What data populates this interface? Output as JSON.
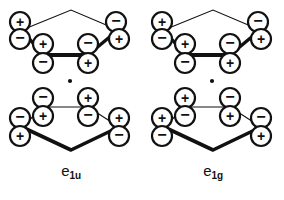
{
  "figure": {
    "name": "cyclopentadienyl-ring-pi-orbital-symmetry-diagram",
    "panels": [
      {
        "id": "e1u",
        "label_base": "e",
        "label_sub": "1u",
        "center_dot": true,
        "rings": [
          {
            "id": "upper-ring",
            "position": "upper",
            "lobes": [
              {
                "id": "ul-back-left-up",
                "sign": "+",
                "cx": 20,
                "cy": 22,
                "r": 10
              },
              {
                "id": "ul-back-left-down",
                "sign": "−",
                "cx": 20,
                "cy": 39,
                "r": 10
              },
              {
                "id": "ul-front-left-up",
                "sign": "+",
                "cx": 43,
                "cy": 44,
                "r": 10
              },
              {
                "id": "ul-front-left-down",
                "sign": "−",
                "cx": 43,
                "cy": 63,
                "r": 10
              },
              {
                "id": "ul-front-right-up",
                "sign": "−",
                "cx": 88,
                "cy": 44,
                "r": 10
              },
              {
                "id": "ul-front-right-down",
                "sign": "+",
                "cx": 88,
                "cy": 63,
                "r": 10
              },
              {
                "id": "ul-back-right-up",
                "sign": "−",
                "cx": 116,
                "cy": 22,
                "r": 10
              },
              {
                "id": "ul-back-right-down",
                "sign": "+",
                "cx": 119,
                "cy": 39,
                "r": 10
              }
            ]
          },
          {
            "id": "lower-ring",
            "position": "lower",
            "lobes": [
              {
                "id": "ll-back-left-up",
                "sign": "−",
                "cx": 43,
                "cy": 98,
                "r": 10
              },
              {
                "id": "ll-back-left-down",
                "sign": "+",
                "cx": 43,
                "cy": 116,
                "r": 10
              },
              {
                "id": "ll-back-right-up",
                "sign": "+",
                "cx": 88,
                "cy": 98,
                "r": 10
              },
              {
                "id": "ll-back-right-down",
                "sign": "−",
                "cx": 88,
                "cy": 116,
                "r": 10
              },
              {
                "id": "ll-front-left-up",
                "sign": "−",
                "cx": 20,
                "cy": 118,
                "r": 10
              },
              {
                "id": "ll-front-left-down",
                "sign": "+",
                "cx": 20,
                "cy": 136,
                "r": 10
              },
              {
                "id": "ll-front-right-up",
                "sign": "+",
                "cx": 119,
                "cy": 118,
                "r": 10
              },
              {
                "id": "ll-front-right-down",
                "sign": "−",
                "cx": 119,
                "cy": 136,
                "r": 10
              }
            ]
          }
        ]
      },
      {
        "id": "e1g",
        "label_base": "e",
        "label_sub": "1g",
        "center_dot": true,
        "rings": [
          {
            "id": "upper-ring",
            "position": "upper",
            "lobes": [
              {
                "id": "ul-back-left-up",
                "sign": "+",
                "cx": 20,
                "cy": 22,
                "r": 10
              },
              {
                "id": "ul-back-left-down",
                "sign": "−",
                "cx": 20,
                "cy": 39,
                "r": 10
              },
              {
                "id": "ul-front-left-up",
                "sign": "+",
                "cx": 43,
                "cy": 44,
                "r": 10
              },
              {
                "id": "ul-front-left-down",
                "sign": "−",
                "cx": 43,
                "cy": 63,
                "r": 10
              },
              {
                "id": "ul-front-right-up",
                "sign": "−",
                "cx": 88,
                "cy": 44,
                "r": 10
              },
              {
                "id": "ul-front-right-down",
                "sign": "+",
                "cx": 88,
                "cy": 63,
                "r": 10
              },
              {
                "id": "ul-back-right-up",
                "sign": "−",
                "cx": 116,
                "cy": 22,
                "r": 10
              },
              {
                "id": "ul-back-right-down",
                "sign": "+",
                "cx": 119,
                "cy": 39,
                "r": 10
              }
            ]
          },
          {
            "id": "lower-ring",
            "position": "lower",
            "lobes": [
              {
                "id": "ll-back-left-up",
                "sign": "+",
                "cx": 43,
                "cy": 98,
                "r": 10
              },
              {
                "id": "ll-back-left-down",
                "sign": "−",
                "cx": 43,
                "cy": 116,
                "r": 10
              },
              {
                "id": "ll-back-right-up",
                "sign": "−",
                "cx": 88,
                "cy": 98,
                "r": 10
              },
              {
                "id": "ll-back-right-down",
                "sign": "+",
                "cx": 88,
                "cy": 116,
                "r": 10
              },
              {
                "id": "ll-front-left-up",
                "sign": "+",
                "cx": 20,
                "cy": 118,
                "r": 10
              },
              {
                "id": "ll-front-left-down",
                "sign": "−",
                "cx": 20,
                "cy": 136,
                "r": 10
              },
              {
                "id": "ll-front-right-up",
                "sign": "−",
                "cx": 119,
                "cy": 118,
                "r": 10
              },
              {
                "id": "ll-front-right-down",
                "sign": "+",
                "cx": 119,
                "cy": 136,
                "r": 10
              }
            ]
          }
        ]
      }
    ],
    "colors": {
      "ink": "#111111",
      "background": "#ffffff",
      "lobe_fill": "#ffffff",
      "lobe_stroke": "#111111"
    },
    "geometry": {
      "upper_ring_back_apex": {
        "x": 71,
        "y": 10
      },
      "upper_ring_back_left": {
        "x": 22,
        "y": 30
      },
      "upper_ring_back_right": {
        "x": 118,
        "y": 30
      },
      "upper_ring_front_left": {
        "x": 43,
        "y": 55
      },
      "upper_ring_front_right": {
        "x": 88,
        "y": 55
      },
      "lower_ring_back_left": {
        "x": 43,
        "y": 107
      },
      "lower_ring_back_right": {
        "x": 88,
        "y": 107
      },
      "lower_ring_front_left": {
        "x": 22,
        "y": 127
      },
      "lower_ring_front_right": {
        "x": 119,
        "y": 127
      },
      "lower_ring_front_apex": {
        "x": 71,
        "y": 150
      },
      "center_dot": {
        "x": 70,
        "y": 81,
        "r": 2
      }
    }
  }
}
